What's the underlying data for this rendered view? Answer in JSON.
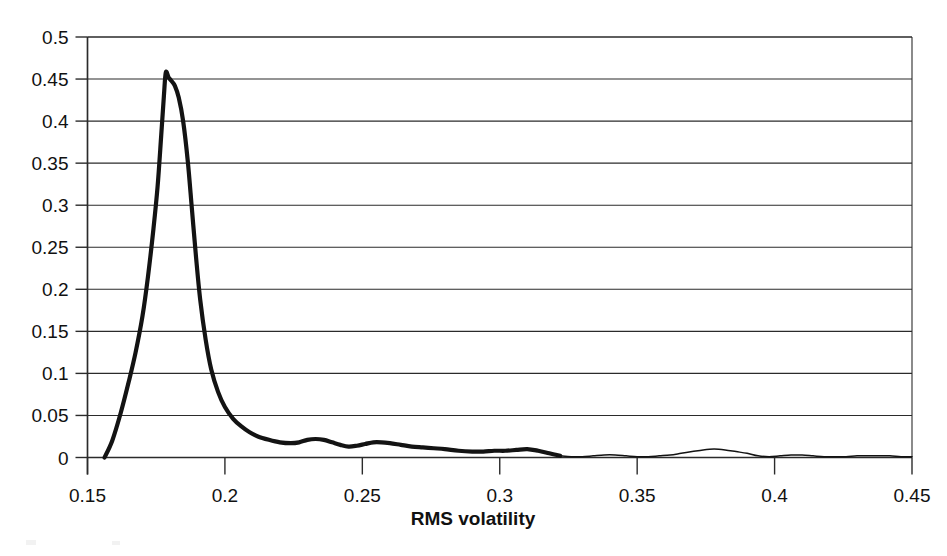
{
  "chart_data": {
    "type": "line",
    "title": "",
    "subtitle": "",
    "xlabel": "RMS volatility",
    "ylabel": "",
    "xlim": [
      0.15,
      0.45
    ],
    "ylim": [
      0,
      0.5
    ],
    "grid": "horizontal",
    "legend": "none",
    "xticks": [
      "0.15",
      "0.2",
      "0.25",
      "0.3",
      "0.35",
      "0.4",
      "0.45"
    ],
    "xtick_values": [
      0.15,
      0.2,
      0.25,
      0.3,
      0.35,
      0.4,
      0.45
    ],
    "yticks": [
      "0",
      "0.05",
      "0.1",
      "0.15",
      "0.2",
      "0.25",
      "0.3",
      "0.35",
      "0.4",
      "0.45",
      "0.5"
    ],
    "ytick_values": [
      0,
      0.05,
      0.1,
      0.15,
      0.2,
      0.25,
      0.3,
      0.35,
      0.4,
      0.45,
      0.5
    ],
    "series": [
      {
        "name": "RMS volatility density",
        "color": "#131313",
        "peak_x": 0.1785,
        "peak_y": 0.458,
        "x": [
          0.1562,
          0.159,
          0.162,
          0.165,
          0.1675,
          0.17,
          0.172,
          0.174,
          0.1755,
          0.1768,
          0.1778,
          0.1785,
          0.1795,
          0.1805,
          0.1818,
          0.1832,
          0.1848,
          0.1865,
          0.188,
          0.1895,
          0.191,
          0.193,
          0.195,
          0.1975,
          0.2,
          0.203,
          0.206,
          0.209,
          0.212,
          0.216,
          0.22,
          0.224,
          0.227,
          0.23,
          0.233,
          0.236,
          0.239,
          0.242,
          0.245,
          0.248,
          0.251,
          0.254,
          0.257,
          0.26,
          0.264,
          0.268,
          0.272,
          0.276,
          0.28,
          0.285,
          0.29,
          0.294,
          0.298,
          0.302,
          0.306,
          0.31,
          0.314,
          0.318,
          0.322,
          0.326,
          0.33,
          0.334,
          0.338,
          0.342,
          0.346,
          0.35,
          0.354,
          0.358,
          0.362,
          0.366,
          0.37,
          0.374,
          0.378,
          0.382,
          0.386,
          0.39,
          0.394,
          0.398,
          0.402,
          0.406,
          0.41,
          0.414,
          0.418,
          0.422,
          0.426,
          0.43,
          0.434,
          0.438,
          0.442,
          0.446,
          0.45
        ],
        "y": [
          0.0,
          0.02,
          0.052,
          0.09,
          0.125,
          0.168,
          0.215,
          0.272,
          0.322,
          0.382,
          0.43,
          0.458,
          0.452,
          0.448,
          0.442,
          0.428,
          0.4,
          0.352,
          0.295,
          0.238,
          0.188,
          0.14,
          0.105,
          0.078,
          0.06,
          0.046,
          0.037,
          0.03,
          0.025,
          0.021,
          0.018,
          0.017,
          0.018,
          0.021,
          0.022,
          0.021,
          0.018,
          0.015,
          0.013,
          0.014,
          0.016,
          0.018,
          0.018,
          0.017,
          0.015,
          0.013,
          0.012,
          0.011,
          0.01,
          0.008,
          0.007,
          0.007,
          0.008,
          0.008,
          0.009,
          0.01,
          0.008,
          0.005,
          0.002,
          0.001,
          0.001,
          0.002,
          0.003,
          0.003,
          0.002,
          0.001,
          0.001,
          0.002,
          0.003,
          0.005,
          0.007,
          0.009,
          0.01,
          0.009,
          0.007,
          0.005,
          0.002,
          0.001,
          0.002,
          0.003,
          0.003,
          0.002,
          0.001,
          0.001,
          0.001,
          0.002,
          0.002,
          0.002,
          0.002,
          0.001,
          0.001
        ],
        "thin_tail_starts_at_x": 0.319
      }
    ]
  },
  "axis": {
    "x_title": "RMS volatility"
  }
}
